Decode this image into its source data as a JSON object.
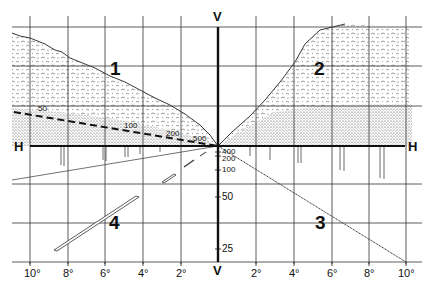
{
  "diagram": {
    "title": "",
    "axes": {
      "horizontal_label_left": "H",
      "horizontal_label_right": "H",
      "vertical_label_top": "V",
      "vertical_label_bottom": "V"
    },
    "quadrants": [
      {
        "id": "1",
        "label": "1",
        "description": "upper-left tree mass receding to vanishing point"
      },
      {
        "id": "2",
        "label": "2",
        "description": "upper-right tree mass receding to vanishing point"
      },
      {
        "id": "3",
        "label": "3",
        "description": "lower-right ground line to vanishing point"
      },
      {
        "id": "4",
        "label": "4",
        "description": "lower-left road markings in perspective"
      }
    ],
    "distance_labels_dashed_line": [
      "50",
      "100",
      "200",
      "500"
    ],
    "distance_labels_vertical_axis": [
      "400",
      "200",
      "100",
      "50",
      "25"
    ],
    "degree_ticks_left": [
      "10°",
      "8°",
      "6°",
      "4°",
      "2°"
    ],
    "degree_ticks_right": [
      "2°",
      "4°",
      "6°",
      "8°",
      "10°"
    ],
    "colors": {
      "ink": "#111111",
      "grid": "#333333",
      "stipple": "#555555",
      "background": "#ffffff"
    }
  }
}
